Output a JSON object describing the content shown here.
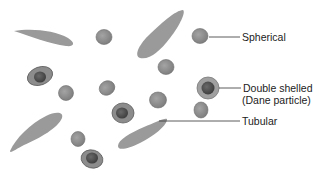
{
  "diagram": {
    "labels": {
      "spherical": "Spherical",
      "double_shelled_line1": "Double shelled",
      "double_shelled_line2": "(Dane particle)",
      "tubular": "Tubular"
    },
    "colors": {
      "particle_fill": "#8f8f8f",
      "particle_stroke": "#6e6e6e",
      "tubular_fill": "#9a9a9a",
      "outer_shell": "#999999",
      "inner_core": "#5a5a5a",
      "leader_line": "#333333",
      "text": "#222222"
    },
    "particle_types": [
      "spherical",
      "double-shelled (Dane particle)",
      "tubular"
    ]
  }
}
